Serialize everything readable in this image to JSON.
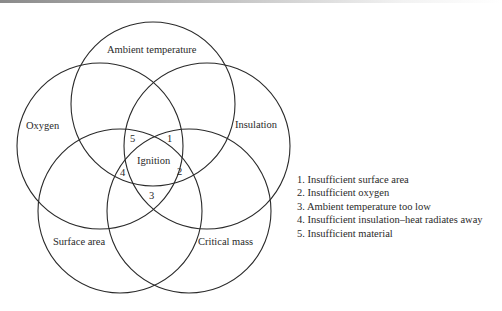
{
  "diagram": {
    "type": "venn",
    "sets": [
      {
        "id": "ambient",
        "label": "Ambient temperature"
      },
      {
        "id": "oxygen",
        "label": "Oxygen"
      },
      {
        "id": "insulation",
        "label": "Insulation"
      },
      {
        "id": "surface",
        "label": "Surface area"
      },
      {
        "id": "critical",
        "label": "Critical mass"
      }
    ],
    "center_label": "Ignition",
    "region_numbers": [
      "1",
      "2",
      "3",
      "4",
      "5"
    ],
    "stroke_color": "#2a2a2a"
  },
  "legend": {
    "items": [
      "1. Insufficient surface area",
      "2. Insufficient oxygen",
      "3. Ambient temperature too low",
      "4. Insufficient insulation–heat radiates away",
      "5. Insufficient material"
    ]
  }
}
